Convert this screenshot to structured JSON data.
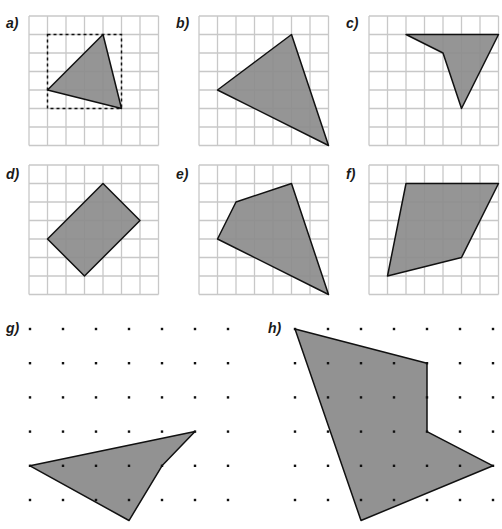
{
  "style": {
    "grid_color": "#c8c8c8",
    "fill_color": "#8c8c8c",
    "stroke_color": "#111111",
    "dot_color": "#111111"
  },
  "panels": [
    {
      "id": "a",
      "label": "a)",
      "type": "grid",
      "origin": [
        29,
        16
      ],
      "cell": 18.5,
      "cells": 7,
      "polygon": [
        [
          1,
          4
        ],
        [
          4,
          1
        ],
        [
          5,
          5
        ]
      ],
      "bounding_box": [
        [
          1,
          1
        ],
        [
          5,
          1
        ],
        [
          5,
          5
        ],
        [
          1,
          5
        ]
      ]
    },
    {
      "id": "b",
      "label": "b)",
      "type": "grid",
      "origin": [
        199,
        16
      ],
      "cell": 18.5,
      "cells": 7,
      "polygon": [
        [
          1,
          4
        ],
        [
          5,
          1
        ],
        [
          7,
          7
        ]
      ]
    },
    {
      "id": "c",
      "label": "c)",
      "type": "grid",
      "origin": [
        369,
        16
      ],
      "cell": 18.5,
      "cells": 7,
      "polygon": [
        [
          2,
          1
        ],
        [
          7,
          1
        ],
        [
          5,
          5
        ],
        [
          4,
          2
        ]
      ]
    },
    {
      "id": "d",
      "label": "d)",
      "type": "grid",
      "origin": [
        29,
        165
      ],
      "cell": 18.5,
      "cells": 7,
      "polygon": [
        [
          1,
          4
        ],
        [
          4,
          1
        ],
        [
          6,
          3
        ],
        [
          3,
          6
        ]
      ]
    },
    {
      "id": "e",
      "label": "e)",
      "type": "grid",
      "origin": [
        199,
        165
      ],
      "cell": 18.5,
      "cells": 7,
      "polygon": [
        [
          1,
          4
        ],
        [
          2,
          2
        ],
        [
          5,
          1
        ],
        [
          7,
          7
        ]
      ]
    },
    {
      "id": "f",
      "label": "f)",
      "type": "grid",
      "origin": [
        369,
        165
      ],
      "cell": 18.5,
      "cells": 7,
      "polygon": [
        [
          1,
          6
        ],
        [
          2,
          1
        ],
        [
          7,
          1
        ],
        [
          5,
          5
        ]
      ]
    },
    {
      "id": "g",
      "label": "g)",
      "type": "dots",
      "origin": [
        30,
        329
      ],
      "spacing_x": 33,
      "spacing_y": 34.2,
      "cols": 7,
      "rows": 6,
      "polygon": [
        [
          0,
          4
        ],
        [
          5,
          3
        ],
        [
          4,
          4
        ],
        [
          3,
          5.6
        ]
      ]
    },
    {
      "id": "h",
      "label": "h)",
      "type": "dots",
      "origin": [
        295,
        329
      ],
      "spacing_x": 33,
      "spacing_y": 34.2,
      "cols": 7,
      "rows": 6,
      "polygon": [
        [
          0,
          0
        ],
        [
          4,
          1
        ],
        [
          4,
          3
        ],
        [
          6,
          4
        ],
        [
          2,
          5.6
        ]
      ]
    }
  ],
  "labels": {
    "a": "a)",
    "b": "b)",
    "c": "c)",
    "d": "d)",
    "e": "e)",
    "f": "f)",
    "g": "g)",
    "h": "h)"
  }
}
